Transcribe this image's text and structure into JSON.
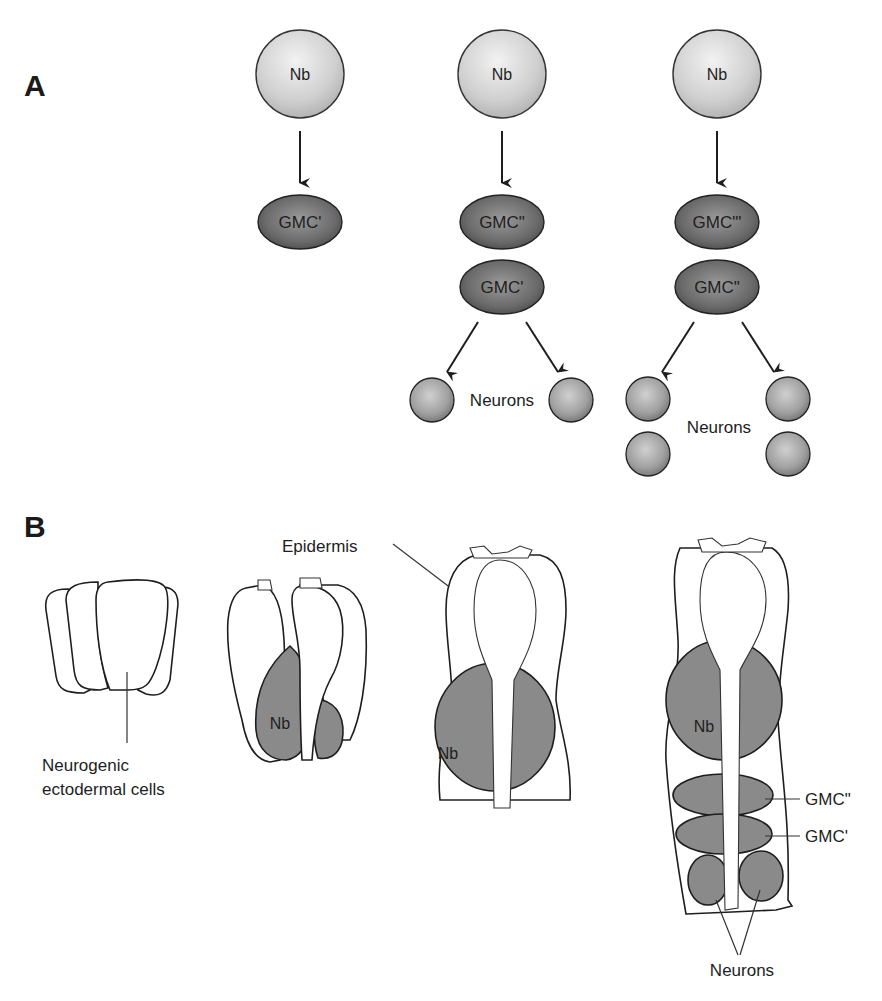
{
  "figure": {
    "panel_a": {
      "label": "A",
      "columns": [
        {
          "neuroblast": "Nb",
          "gmcs": [
            "GMC'"
          ],
          "neurons_label": null,
          "neuron_count": 0
        },
        {
          "neuroblast": "Nb",
          "gmcs": [
            "GMC\"",
            "GMC'"
          ],
          "neurons_label": "Neurons",
          "neuron_count": 2
        },
        {
          "neuroblast": "Nb",
          "gmcs": [
            "GMC\"'",
            "GMC\""
          ],
          "neurons_label": "Neurons",
          "neuron_count": 4
        }
      ]
    },
    "panel_b": {
      "label": "B",
      "stage1": {
        "label_line1": "Neurogenic",
        "label_line2": "ectodermal cells"
      },
      "stage2": {
        "nb_label": "Nb"
      },
      "stage3": {
        "nb_label": "Nb",
        "epidermis_label": "Epidermis"
      },
      "stage4": {
        "nb_label": "Nb",
        "gmc_upper_label": "GMC\"",
        "gmc_lower_label": "GMC'",
        "neurons_label": "Neurons"
      }
    },
    "colors": {
      "neuroblast_fill": "#d4d4d4",
      "gmc_fill": "#6e6e6e",
      "neuron_fill": "#a6a6a6",
      "shaded_cell": "#8a8a8a",
      "line": "#1e1e1e"
    }
  }
}
